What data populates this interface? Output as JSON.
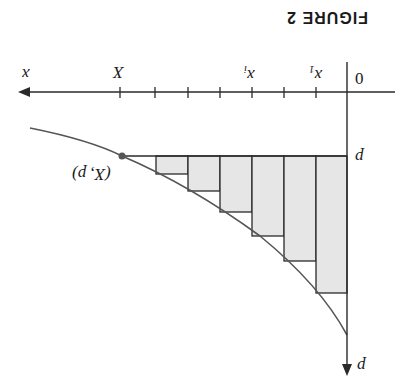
{
  "figure": {
    "title": "FIGURE 2",
    "orientation": "rotated 180 degrees",
    "axes": {
      "horizontal_label": "x",
      "vertical_label": "p",
      "origin_label": "0"
    },
    "tick_labels": {
      "x1": "x",
      "x1_sub": "1",
      "xi": "x",
      "xi_sub": "i",
      "X": "X"
    },
    "point_label": "(X, p)",
    "level_label": "p",
    "colors": {
      "line": "#2a2a2a",
      "curve": "#555555",
      "fill": "#e6e6e6",
      "point": "#555555"
    },
    "rectangles_count": 6
  }
}
